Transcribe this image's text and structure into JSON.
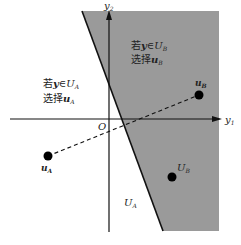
{
  "diagram": {
    "colors": {
      "region_b": "#9a9a9a",
      "line": "#111111",
      "background": "#ffffff"
    },
    "axes": {
      "x_label": "y",
      "x_sub": "1",
      "y_label": "y",
      "y_sub": "2",
      "origin_label": "O"
    },
    "region_b_text": {
      "line1_prefix": "若",
      "line1_var": "y",
      "line1_in": "∈",
      "line1_set": "U",
      "line1_sub": "B",
      "line2_prefix": "选择",
      "line2_var": "u",
      "line2_sub": "B"
    },
    "region_a_text": {
      "line1_prefix": "若",
      "line1_var": "y",
      "line1_in": "∈",
      "line1_set": "U",
      "line1_sub": "A",
      "line2_prefix": "选择",
      "line2_var": "u",
      "line2_sub": "A"
    },
    "points": {
      "uA": {
        "label": "u",
        "sub": "A"
      },
      "uB": {
        "label": "u",
        "sub": "B"
      },
      "UB": {
        "label": "U",
        "sub": "B"
      }
    },
    "region_a_label": {
      "label": "U",
      "sub": "A"
    }
  }
}
